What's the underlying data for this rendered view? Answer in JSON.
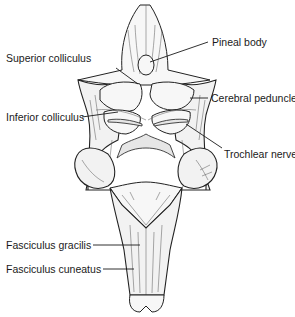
{
  "figure": {
    "labels": {
      "pineal_body": "Pineal body",
      "superior_colliculus": "Superior colliculus",
      "cerebral_peduncle": "Cerebral peduncle",
      "inferior_colliculus": "Inferior colliculus",
      "trochlear_nerve": "Trochlear nerve",
      "fasciculus_gracilis": "Fasciculus gracilis",
      "fasciculus_cuneatus": "Fasciculus cuneatus"
    }
  }
}
